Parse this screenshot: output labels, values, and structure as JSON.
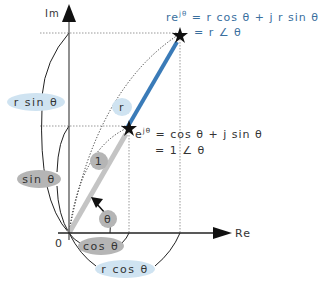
{
  "axes": {
    "imag_label": "Im",
    "real_label": "Re",
    "origin_label": "0"
  },
  "equations": {
    "general_line1": "reʲᶿ = r cos θ + j r sin θ",
    "general_line1_lhs": "re",
    "general_line1_sup": "jθ",
    "general_line1_rhs": "= r cos θ + j r sin θ",
    "general_line2": "= r ∠ θ",
    "unit_line1_lhs": "e",
    "unit_line1_sup": "jθ",
    "unit_line1_rhs": "= cos θ + j sin θ",
    "unit_line2": "= 1 ∠ θ"
  },
  "labels": {
    "r_sin": "r sin θ",
    "sin": "sin θ",
    "r": "r",
    "one": "1",
    "theta": "θ",
    "cos": "cos θ",
    "r_cos": "r cos θ"
  },
  "colors": {
    "blue_vector": "#3a7bb8",
    "gray_vector": "#c4c4c4",
    "blue_pill": "#cfe3f1",
    "gray_pill": "#b5b5b5",
    "text_blue": "#3a6f9e",
    "axis": "#222222"
  },
  "geometry": {
    "origin": [
      69,
      233
    ],
    "unit_point": [
      129,
      128
    ],
    "r_point": [
      180,
      35
    ],
    "re_axis_end": [
      232,
      233
    ],
    "im_axis_end": [
      69,
      4
    ]
  }
}
